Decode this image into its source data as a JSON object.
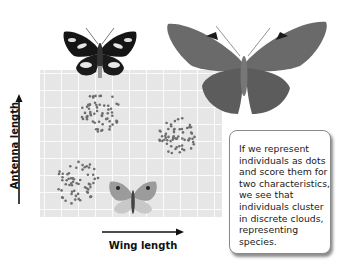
{
  "figure": {
    "x_axis_label": "Wing length",
    "y_axis_label": "Antenna length",
    "callout_text": "If we represent individuals as dots and score them for two characteristics, we see that individuals cluster in discrete clouds, representing species."
  },
  "clusters": [
    {
      "name": "species-upper-left",
      "center": [
        100,
        112
      ],
      "radius": 20
    },
    {
      "name": "species-middle-right",
      "center": [
        178,
        136
      ],
      "radius": 19
    },
    {
      "name": "species-lower-left",
      "center": [
        78,
        183
      ],
      "radius": 22
    }
  ],
  "colors": {
    "plot_bg": "#e6e6e6",
    "grid": "#ffffff",
    "dot": "#6e6e6e",
    "callout_border": "#8a8a8a"
  },
  "chart_data": {
    "type": "scatter",
    "title": "",
    "xlabel": "Wing length",
    "ylabel": "Antenna length",
    "series": [
      {
        "name": "cluster-1 (upper left)",
        "center_relative": [
          0.33,
          0.28
        ]
      },
      {
        "name": "cluster-2 (middle right)",
        "center_relative": [
          0.76,
          0.45
        ]
      },
      {
        "name": "cluster-3 (lower left)",
        "center_relative": [
          0.21,
          0.77
        ]
      }
    ],
    "grid": true,
    "legend": "none"
  }
}
